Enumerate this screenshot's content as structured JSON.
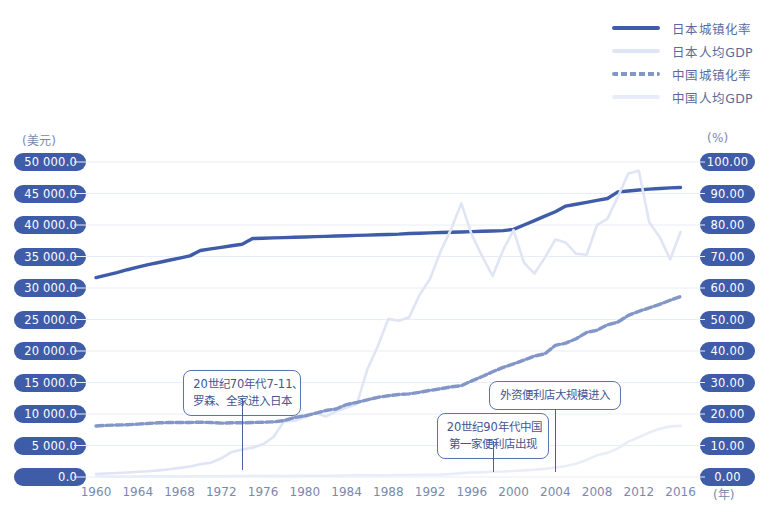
{
  "legend": {
    "items": [
      {
        "label": "日本城镇化率",
        "color": "#3f5ca8",
        "style": "solid"
      },
      {
        "label": "日本人均GDP",
        "color": "#dfe5f5",
        "style": "solid"
      },
      {
        "label": "中国城镇化率",
        "color": "#8296c8",
        "style": "dashed"
      },
      {
        "label": "中国人均GDP",
        "color": "#e8edf9",
        "style": "solid"
      }
    ]
  },
  "axes": {
    "left_unit": "(美元)",
    "right_unit": "(%)",
    "x_unit": "(年)",
    "left_ticks": [
      "50 000.0",
      "45 000.0",
      "40 000.0",
      "35 000.0",
      "30 000.0",
      "25 000.0",
      "20 000.0",
      "15 000.0",
      "10 000.0",
      "5 000.0",
      "0.0"
    ],
    "right_ticks": [
      "100.00",
      "90.00",
      "80.00",
      "70.00",
      "60.00",
      "50.00",
      "40.00",
      "30.00",
      "20.00",
      "10.00",
      "0.00"
    ],
    "x_ticks": [
      "1960",
      "1964",
      "1968",
      "1972",
      "1976",
      "1980",
      "1984",
      "1988",
      "1992",
      "1996",
      "2000",
      "2004",
      "2008",
      "2012",
      "2016"
    ]
  },
  "annotations": [
    {
      "id": "anno-1",
      "lines": [
        "20世纪70年代7-11、",
        "罗森、全家进入日本"
      ],
      "year": 1974
    },
    {
      "id": "anno-2",
      "lines": [
        "20世纪90年代中国",
        "第一家便利店出现"
      ],
      "year": 1998
    },
    {
      "id": "anno-3",
      "lines": [
        "外资便利店大规模进入"
      ],
      "year": 2004
    }
  ],
  "colors": {
    "pill_bg": "#3f5ca8",
    "pill_text": "#ffffff",
    "grid": "#e9edf7",
    "tick_text": "#7b88ad",
    "japan_urban": "#3f5ca8",
    "japan_gdp": "#dfe5f5",
    "china_urban": "#8296c8",
    "china_gdp": "#e8edf9",
    "anno_border": "#5b74b8",
    "anno_text": "#44558f"
  },
  "chart_data": {
    "type": "line",
    "title": "",
    "xlabel": "(年)",
    "ylabel": "(美元)",
    "y2label": "(%)",
    "xlim": [
      1960,
      2017
    ],
    "ylim": [
      0,
      50000
    ],
    "y2lim": [
      0,
      100
    ],
    "grid": true,
    "legend_position": "top-right",
    "x": [
      1960,
      1961,
      1962,
      1963,
      1964,
      1965,
      1966,
      1967,
      1968,
      1969,
      1970,
      1971,
      1972,
      1973,
      1974,
      1975,
      1976,
      1977,
      1978,
      1979,
      1980,
      1981,
      1982,
      1983,
      1984,
      1985,
      1986,
      1987,
      1988,
      1989,
      1990,
      1991,
      1992,
      1993,
      1994,
      1995,
      1996,
      1997,
      1998,
      1999,
      2000,
      2001,
      2002,
      2003,
      2004,
      2005,
      2006,
      2007,
      2008,
      2009,
      2010,
      2011,
      2012,
      2013,
      2014,
      2015,
      2016
    ],
    "series": [
      {
        "name": "日本城镇化率",
        "axis": "right",
        "unit": "%",
        "color": "#3f5ca8",
        "style": "solid",
        "values": [
          63.3,
          64.1,
          64.9,
          65.8,
          66.6,
          67.4,
          68.1,
          68.8,
          69.5,
          70.2,
          71.9,
          72.4,
          72.9,
          73.4,
          73.9,
          75.7,
          75.8,
          75.9,
          76.0,
          76.1,
          76.2,
          76.3,
          76.4,
          76.5,
          76.6,
          76.7,
          76.8,
          76.9,
          77.0,
          77.1,
          77.3,
          77.4,
          77.5,
          77.6,
          77.7,
          77.8,
          77.9,
          78.0,
          78.1,
          78.2,
          78.6,
          80.0,
          81.4,
          82.8,
          84.2,
          86.0,
          86.6,
          87.2,
          87.8,
          88.4,
          90.5,
          90.8,
          91.1,
          91.4,
          91.6,
          91.8,
          91.9
        ]
      },
      {
        "name": "日本人均GDP",
        "axis": "left",
        "unit": "美元",
        "color": "#dfe5f5",
        "style": "solid",
        "values": [
          479,
          564,
          634,
          724,
          836,
          920,
          1059,
          1229,
          1451,
          1669,
          2038,
          2270,
          2967,
          3976,
          4354,
          4659,
          5198,
          6336,
          8822,
          8942,
          9465,
          10212,
          9578,
          10425,
          10977,
          11599,
          17113,
          20750,
          25096,
          24804,
          25371,
          28915,
          31459,
          35766,
          39269,
          43440,
          38436,
          35022,
          31902,
          36026,
          39173,
          34018,
          32289,
          34808,
          37689,
          37218,
          35433,
          35275,
          39992,
          41014,
          44508,
          48168,
          48603,
          40454,
          38109,
          34524,
          38894
        ]
      },
      {
        "name": "中国城镇化率",
        "axis": "right",
        "unit": "%",
        "color": "#8296c8",
        "style": "dashed",
        "values": [
          16.2,
          16.4,
          16.5,
          16.6,
          16.8,
          17.0,
          17.2,
          17.3,
          17.3,
          17.3,
          17.4,
          17.3,
          17.1,
          17.2,
          17.2,
          17.3,
          17.4,
          17.5,
          17.9,
          18.9,
          19.4,
          20.2,
          21.1,
          21.6,
          23.0,
          23.7,
          24.5,
          25.3,
          25.8,
          26.2,
          26.4,
          26.9,
          27.5,
          28.0,
          28.6,
          29.0,
          30.5,
          31.9,
          33.4,
          34.8,
          35.9,
          37.1,
          38.4,
          39.1,
          41.8,
          42.5,
          43.9,
          45.9,
          46.6,
          48.3,
          49.2,
          51.3,
          52.6,
          53.7,
          54.8,
          56.1,
          57.3
        ]
      },
      {
        "name": "中国人均GDP",
        "axis": "left",
        "unit": "美元",
        "color": "#e8edf9",
        "style": "solid",
        "values": [
          89,
          75,
          70,
          73,
          84,
          97,
          103,
          96,
          90,
          99,
          111,
          117,
          130,
          155,
          159,
          177,
          163,
          183,
          154,
          182,
          194,
          197,
          203,
          225,
          250,
          294,
          281,
          251,
          283,
          310,
          317,
          333,
          366,
          377,
          473,
          609,
          709,
          781,
          828,
          873,
          959,
          1053,
          1148,
          1288,
          1508,
          1753,
          2099,
          2693,
          3468,
          3832,
          4550,
          5618,
          6316,
          7050,
          7651,
          8033,
          8123
        ]
      }
    ]
  }
}
